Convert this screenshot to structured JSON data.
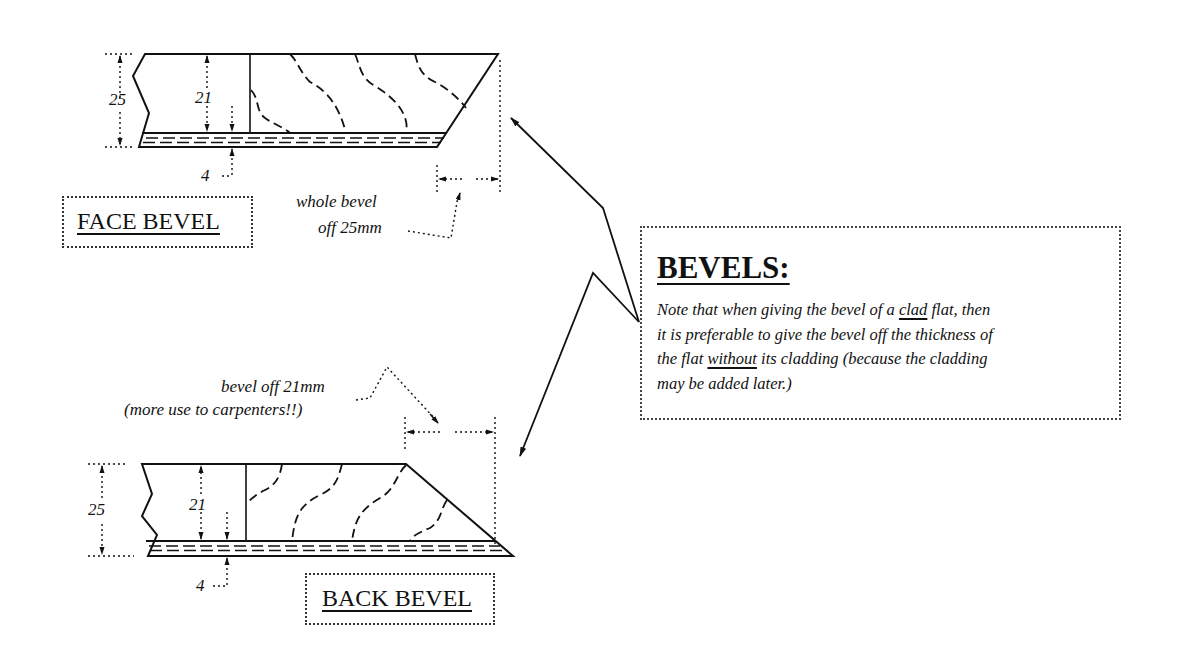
{
  "face_bevel": {
    "label": "FACE BEVEL",
    "dim_total": "25",
    "dim_core": "21",
    "dim_cladding": "4",
    "annotation_line1": "whole bevel",
    "annotation_line2": "off 25mm"
  },
  "back_bevel": {
    "label": "BACK BEVEL",
    "dim_total": "25",
    "dim_core": "21",
    "dim_cladding": "4",
    "annotation_line1": "bevel off 21mm",
    "annotation_line2": "(more use to carpenters!!)"
  },
  "callout": {
    "title": "BEVELS:",
    "line1_pre": "Note that when giving the bevel of a ",
    "line1_underlined": "clad",
    "line1_post": " flat, then",
    "line2": "it is preferable to give the bevel off the thickness of",
    "line3_pre": "the flat ",
    "line3_underlined": "without",
    "line3_post": " its cladding (because the cladding",
    "line4": "may be added later.)"
  },
  "colors": {
    "ink": "#111111",
    "background": "#ffffff"
  }
}
